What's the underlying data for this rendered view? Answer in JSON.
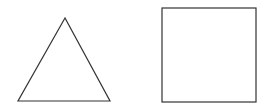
{
  "diagram": {
    "shapes": [
      {
        "type": "triangle",
        "label": "triangle",
        "stroke": "#333333",
        "points": [
          [
            65,
            18
          ],
          [
            18,
            101
          ],
          [
            110,
            101
          ]
        ]
      },
      {
        "type": "square",
        "label": "square",
        "stroke": "#333333",
        "x": 162,
        "y": 8,
        "width": 94,
        "height": 94
      }
    ],
    "background": "#ffffff"
  }
}
